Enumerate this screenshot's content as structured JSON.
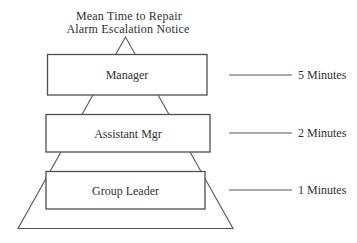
{
  "title": {
    "line1": "Mean Time to Repair",
    "line2": "Alarm Escalation Notice"
  },
  "pyramid": {
    "type": "escalation-pyramid",
    "levels": [
      {
        "label": "Manager",
        "time": "5 Minutes"
      },
      {
        "label": "Assistant Mgr",
        "time": "2 Minutes"
      },
      {
        "label": "Group Leader",
        "time": "1 Minutes"
      }
    ]
  },
  "colors": {
    "background": "#ffffff",
    "line": "#55565a",
    "box_stroke": "#4d4e52",
    "text": "#2f2f31"
  }
}
